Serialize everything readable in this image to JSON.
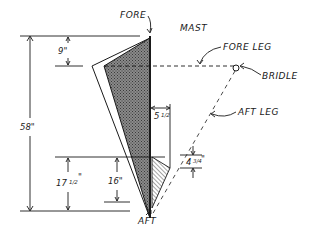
{
  "diagram": {
    "labels": {
      "fore": "FORE",
      "mast": "MAST",
      "fore_leg": "FORE LEG",
      "bridle": "BRIDLE",
      "aft_leg": "AFT LEG",
      "aft": "AFT"
    },
    "dimensions": {
      "top_offset": "9\"",
      "overall": "58\"",
      "lower_outer": "17",
      "lower_outer_frac": "1/2",
      "lower_inner": "16\"",
      "mast_offset": "5",
      "mast_offset_frac": "1/2",
      "fin_width": "4",
      "fin_width_frac": "3/4"
    },
    "colors": {
      "ink": "#1a1a1a",
      "sail_fill": "#6e6e6e",
      "background": "#ffffff"
    }
  }
}
